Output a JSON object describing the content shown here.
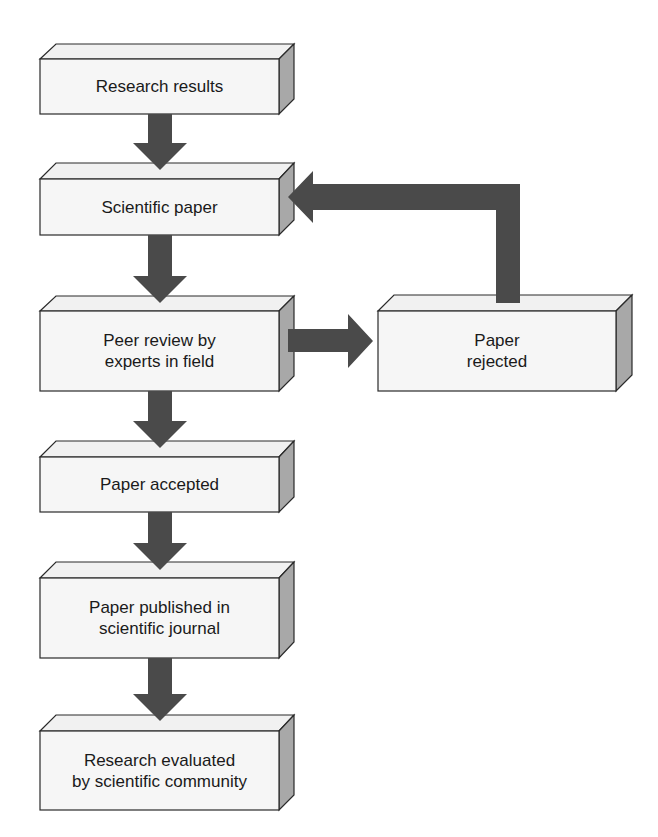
{
  "diagram": {
    "colors": {
      "front_face": "#f6f6f6",
      "top_face": "#f1f1f1",
      "side_face": "#a8a8a8",
      "outline": "#2a2a2a",
      "arrow": "#4a4a4a",
      "text": "#1a1a1a"
    },
    "nodes": [
      {
        "id": "research-results",
        "text": "Research results"
      },
      {
        "id": "scientific-paper",
        "text": "Scientific paper"
      },
      {
        "id": "peer-review",
        "text": "Peer review by\nexperts in field"
      },
      {
        "id": "paper-rejected",
        "text": "Paper\nrejected"
      },
      {
        "id": "paper-accepted",
        "text": "Paper accepted"
      },
      {
        "id": "paper-published",
        "text": "Paper published in\nscientific journal"
      },
      {
        "id": "research-evaluated",
        "text": "Research evaluated\nby scientific community"
      }
    ],
    "edges": [
      {
        "from": "research-results",
        "to": "scientific-paper"
      },
      {
        "from": "scientific-paper",
        "to": "peer-review"
      },
      {
        "from": "peer-review",
        "to": "paper-rejected"
      },
      {
        "from": "paper-rejected",
        "to": "scientific-paper"
      },
      {
        "from": "peer-review",
        "to": "paper-accepted"
      },
      {
        "from": "paper-accepted",
        "to": "paper-published"
      },
      {
        "from": "paper-published",
        "to": "research-evaluated"
      }
    ]
  }
}
